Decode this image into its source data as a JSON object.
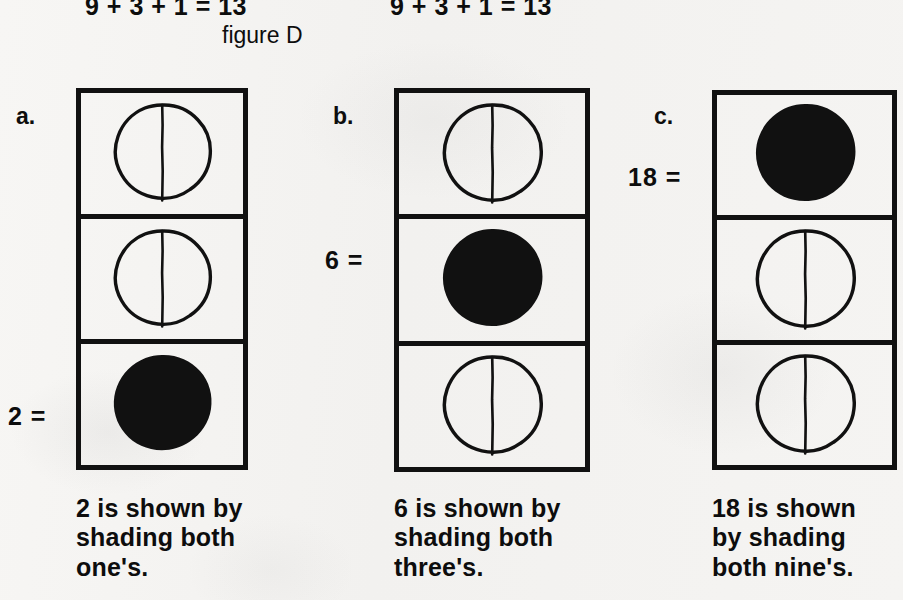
{
  "page": {
    "background_color": "#f4f3f1",
    "ink_color": "#111111",
    "figure_caption": "figure D"
  },
  "top_equations": [
    {
      "text": "9 + 3 + 1 = 13"
    },
    {
      "text": "9 + 3 + 1 = 13"
    }
  ],
  "columns": [
    {
      "id": "a",
      "letter": "a.",
      "value_label": "2 =",
      "value_label_row": 3,
      "cells": [
        {
          "row": 1,
          "shaded": false,
          "circle": "split-circle-open"
        },
        {
          "row": 2,
          "shaded": false,
          "circle": "split-circle-open"
        },
        {
          "row": 3,
          "shaded": true,
          "circle": "filled-circle"
        }
      ],
      "caption": "2 is shown by\nshading both\none's."
    },
    {
      "id": "b",
      "letter": "b.",
      "value_label": "6 =",
      "value_label_row": 2,
      "cells": [
        {
          "row": 1,
          "shaded": false,
          "circle": "split-circle-open"
        },
        {
          "row": 2,
          "shaded": true,
          "circle": "filled-circle"
        },
        {
          "row": 3,
          "shaded": false,
          "circle": "split-circle-open"
        }
      ],
      "caption": "6 is shown by\nshading both\nthree's."
    },
    {
      "id": "c",
      "letter": "c.",
      "value_label": "18 =",
      "value_label_row": 1,
      "cells": [
        {
          "row": 1,
          "shaded": true,
          "circle": "filled-circle"
        },
        {
          "row": 2,
          "shaded": false,
          "circle": "split-circle-open"
        },
        {
          "row": 3,
          "shaded": false,
          "circle": "split-circle-open"
        }
      ],
      "caption": "18  is  shown\nby   shading\nboth nine's."
    }
  ]
}
